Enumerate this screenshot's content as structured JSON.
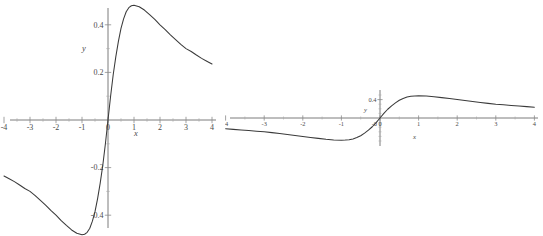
{
  "page": {
    "background": "#ffffff",
    "width": 543,
    "height": 236,
    "curve_color": "#3a3a3a",
    "axis_color": "#6e6e6e",
    "label_color": "#4a4a4a"
  },
  "chart_data": [
    {
      "id": "left-plot",
      "type": "line",
      "title": "",
      "xlabel": "x",
      "ylabel": "y",
      "grid": false,
      "legend": false,
      "xlim": [
        -4,
        4
      ],
      "ylim": [
        -0.55,
        0.55
      ],
      "xticks": [
        -4,
        -3,
        -2,
        -1,
        0,
        1,
        2,
        3,
        4
      ],
      "xticklabels": [
        "-4",
        "-3",
        "-2",
        "-1",
        "0",
        "1",
        "2",
        "3",
        "4"
      ],
      "yticks": [
        -0.4,
        -0.2,
        0.2,
        0.4
      ],
      "yticklabels": [
        "-0.4",
        "-0.2",
        "0.2",
        "0.4"
      ],
      "series": [
        {
          "name": "f(x)",
          "x": [
            -4.0,
            -3.8,
            -3.6,
            -3.4,
            -3.2,
            -3.0,
            -2.8,
            -2.6,
            -2.4,
            -2.2,
            -2.0,
            -1.8,
            -1.6,
            -1.4,
            -1.2,
            -1.0,
            -0.9,
            -0.8,
            -0.7,
            -0.6,
            -0.5,
            -0.4,
            -0.3,
            -0.2,
            -0.1,
            0.0,
            0.1,
            0.2,
            0.3,
            0.4,
            0.5,
            0.6,
            0.7,
            0.8,
            0.9,
            1.0,
            1.2,
            1.4,
            1.6,
            1.8,
            2.0,
            2.2,
            2.4,
            2.6,
            2.8,
            3.0,
            3.2,
            3.4,
            3.6,
            3.8,
            4.0
          ],
          "y": [
            -0.235,
            -0.247,
            -0.259,
            -0.273,
            -0.288,
            -0.3,
            -0.318,
            -0.338,
            -0.358,
            -0.38,
            -0.4,
            -0.423,
            -0.443,
            -0.462,
            -0.476,
            -0.482,
            -0.48,
            -0.472,
            -0.455,
            -0.425,
            -0.385,
            -0.33,
            -0.265,
            -0.19,
            -0.1,
            0.0,
            0.1,
            0.19,
            0.265,
            0.33,
            0.385,
            0.425,
            0.455,
            0.472,
            0.48,
            0.482,
            0.476,
            0.462,
            0.443,
            0.423,
            0.4,
            0.38,
            0.358,
            0.338,
            0.318,
            0.3,
            0.288,
            0.273,
            0.259,
            0.247,
            0.235
          ]
        }
      ]
    },
    {
      "id": "right-plot",
      "type": "line",
      "title": "",
      "xlabel": "x",
      "ylabel": "y",
      "grid": false,
      "legend": false,
      "xlim": [
        -4,
        4
      ],
      "ylim": [
        -0.55,
        0.55
      ],
      "xticks": [
        -4,
        -3,
        -2,
        -1,
        0,
        1,
        2,
        3,
        4
      ],
      "xticklabels": [
        "-4",
        "-3",
        "-2",
        "-1",
        "0",
        "1",
        "2",
        "3",
        "4"
      ],
      "yticks": [
        0.4
      ],
      "yticklabels": [
        "0.4"
      ],
      "extra_ticklabels": [
        "-0"
      ],
      "series": [
        {
          "name": "f(x)",
          "x": [
            -4.0,
            -3.8,
            -3.6,
            -3.4,
            -3.2,
            -3.0,
            -2.8,
            -2.6,
            -2.4,
            -2.2,
            -2.0,
            -1.8,
            -1.6,
            -1.4,
            -1.2,
            -1.0,
            -0.9,
            -0.8,
            -0.7,
            -0.6,
            -0.5,
            -0.4,
            -0.3,
            -0.2,
            -0.1,
            0.0,
            0.1,
            0.2,
            0.3,
            0.4,
            0.5,
            0.6,
            0.7,
            0.8,
            0.9,
            1.0,
            1.2,
            1.4,
            1.6,
            1.8,
            2.0,
            2.2,
            2.4,
            2.6,
            2.8,
            3.0,
            3.2,
            3.4,
            3.6,
            3.8,
            4.0
          ],
          "y": [
            -0.235,
            -0.247,
            -0.259,
            -0.273,
            -0.288,
            -0.3,
            -0.318,
            -0.338,
            -0.358,
            -0.38,
            -0.4,
            -0.423,
            -0.443,
            -0.462,
            -0.476,
            -0.482,
            -0.48,
            -0.472,
            -0.455,
            -0.425,
            -0.385,
            -0.33,
            -0.265,
            -0.19,
            -0.1,
            0.0,
            0.1,
            0.19,
            0.265,
            0.33,
            0.385,
            0.425,
            0.455,
            0.472,
            0.48,
            0.482,
            0.476,
            0.462,
            0.443,
            0.423,
            0.4,
            0.38,
            0.358,
            0.338,
            0.318,
            0.3,
            0.288,
            0.273,
            0.259,
            0.247,
            0.235
          ]
        }
      ]
    }
  ]
}
